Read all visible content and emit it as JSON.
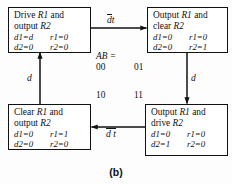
{
  "figure": {
    "caption": "(b)",
    "ab_label": "AB ="
  },
  "states": [
    {
      "id": "drive-r1-output-r2",
      "title_line1_verb": "Drive",
      "title_line1_reg": "R1",
      "title_line1_tail": "and",
      "title_line2_verb": "output",
      "title_line2_reg": "R2",
      "signals": [
        {
          "left": "d1=d",
          "right": "r1=0"
        },
        {
          "left": "d2=0",
          "right": "r2=0"
        }
      ],
      "code": "00"
    },
    {
      "id": "output-r1-clear-r2",
      "title_line1_verb": "Output",
      "title_line1_reg": "R1",
      "title_line1_tail": "and",
      "title_line2_verb": "clear",
      "title_line2_reg": "R2",
      "signals": [
        {
          "left": "d1=0",
          "right": "r1=0"
        },
        {
          "left": "d2=0",
          "right": "r2=1"
        }
      ],
      "code": "01"
    },
    {
      "id": "clear-r1-output-r2",
      "title_line1_verb": "Clear",
      "title_line1_reg": "R1",
      "title_line1_tail": "and",
      "title_line2_verb": "output",
      "title_line2_reg": "R2",
      "signals": [
        {
          "left": "d1=0",
          "right": "r1=1"
        },
        {
          "left": "d2=0",
          "right": "r2=0"
        }
      ],
      "code": "10"
    },
    {
      "id": "output-r1-drive-r2",
      "title_line1_verb": "Output",
      "title_line1_reg": "R1",
      "title_line1_tail": "and",
      "title_line2_verb": "drive",
      "title_line2_reg": "R2",
      "signals": [
        {
          "left": "d1=0",
          "right": "r1=0"
        },
        {
          "left": "d2=1",
          "right": "r2=0"
        }
      ],
      "code": "11"
    }
  ],
  "transitions": [
    {
      "id": "top",
      "from": "drive-r1-output-r2",
      "to": "output-r1-clear-r2",
      "label_bar": "d",
      "label_plain": "t",
      "direction": "right"
    },
    {
      "id": "right",
      "from": "output-r1-clear-r2",
      "to": "output-r1-drive-r2",
      "label_plain": "d",
      "direction": "down"
    },
    {
      "id": "bottom",
      "from": "output-r1-drive-r2",
      "to": "clear-r1-output-r2",
      "label_bar": "d t",
      "direction": "left"
    },
    {
      "id": "left",
      "from": "clear-r1-output-r2",
      "to": "drive-r1-output-r2",
      "label_plain": "d",
      "direction": "up"
    }
  ]
}
